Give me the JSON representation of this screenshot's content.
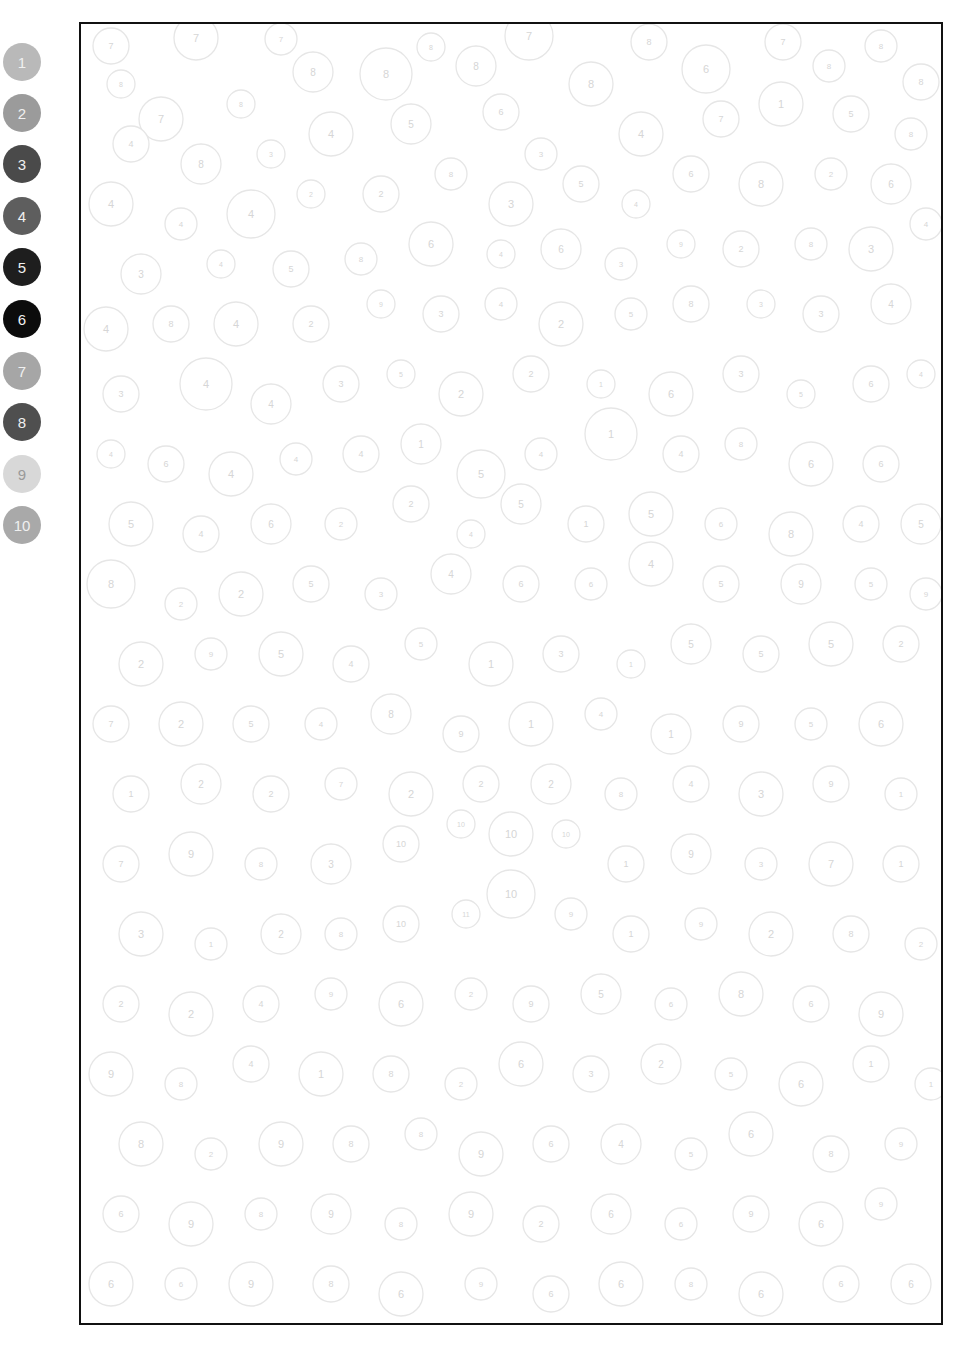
{
  "palette": {
    "swatches": [
      {
        "number": "1",
        "color": "#b9b9b9",
        "top": 43
      },
      {
        "number": "2",
        "color": "#9b9b9b",
        "top": 94
      },
      {
        "number": "3",
        "color": "#4a4a4a",
        "top": 145
      },
      {
        "number": "4",
        "color": "#5e5e5e",
        "top": 197
      },
      {
        "number": "5",
        "color": "#1e1e1e",
        "top": 248
      },
      {
        "number": "6",
        "color": "#0c0c0c",
        "top": 300
      },
      {
        "number": "7",
        "color": "#a6a6a6",
        "top": 352
      },
      {
        "number": "8",
        "color": "#4f4f4f",
        "top": 403
      },
      {
        "number": "9",
        "color": "#d8d8d8",
        "top": 455
      },
      {
        "number": "10",
        "color": "#a9a9a9",
        "top": 506
      }
    ]
  },
  "canvas": {
    "width": 860,
    "height": 1299,
    "border_color": "#111111",
    "circle_stroke": "#e6e6e6",
    "label_color": "#d6d6d6",
    "circles": [
      [
        30,
        22,
        18,
        "7"
      ],
      [
        115,
        14,
        22,
        "7"
      ],
      [
        200,
        15,
        16,
        "7"
      ],
      [
        232,
        48,
        20,
        "8"
      ],
      [
        305,
        50,
        26,
        "8"
      ],
      [
        350,
        23,
        14,
        "8"
      ],
      [
        395,
        42,
        20,
        "8"
      ],
      [
        448,
        12,
        24,
        "7"
      ],
      [
        510,
        60,
        22,
        "8"
      ],
      [
        568,
        18,
        18,
        "8"
      ],
      [
        625,
        45,
        24,
        "6"
      ],
      [
        702,
        18,
        18,
        "7"
      ],
      [
        748,
        42,
        16,
        "8"
      ],
      [
        800,
        22,
        16,
        "8"
      ],
      [
        840,
        58,
        18,
        "8"
      ],
      [
        40,
        60,
        14,
        "8"
      ],
      [
        80,
        95,
        22,
        "7"
      ],
      [
        160,
        80,
        14,
        "8"
      ],
      [
        50,
        120,
        18,
        "4"
      ],
      [
        120,
        140,
        20,
        "8"
      ],
      [
        190,
        130,
        14,
        "3"
      ],
      [
        250,
        110,
        22,
        "4"
      ],
      [
        330,
        100,
        20,
        "5"
      ],
      [
        420,
        88,
        18,
        "6"
      ],
      [
        460,
        130,
        16,
        "3"
      ],
      [
        560,
        110,
        22,
        "4"
      ],
      [
        640,
        95,
        18,
        "7"
      ],
      [
        700,
        80,
        22,
        "1"
      ],
      [
        770,
        90,
        18,
        "5"
      ],
      [
        830,
        110,
        16,
        "8"
      ],
      [
        30,
        180,
        22,
        "4"
      ],
      [
        100,
        200,
        16,
        "4"
      ],
      [
        170,
        190,
        24,
        "4"
      ],
      [
        230,
        170,
        14,
        "2"
      ],
      [
        300,
        170,
        18,
        "2"
      ],
      [
        370,
        150,
        16,
        "8"
      ],
      [
        430,
        180,
        22,
        "3"
      ],
      [
        500,
        160,
        18,
        "5"
      ],
      [
        555,
        180,
        14,
        "4"
      ],
      [
        610,
        150,
        18,
        "6"
      ],
      [
        680,
        160,
        22,
        "8"
      ],
      [
        750,
        150,
        16,
        "2"
      ],
      [
        810,
        160,
        20,
        "6"
      ],
      [
        60,
        250,
        20,
        "3"
      ],
      [
        140,
        240,
        14,
        "4"
      ],
      [
        210,
        245,
        18,
        "5"
      ],
      [
        280,
        235,
        16,
        "8"
      ],
      [
        350,
        220,
        22,
        "6"
      ],
      [
        420,
        230,
        14,
        "4"
      ],
      [
        480,
        225,
        20,
        "6"
      ],
      [
        540,
        240,
        16,
        "3"
      ],
      [
        600,
        220,
        14,
        "9"
      ],
      [
        660,
        225,
        18,
        "2"
      ],
      [
        730,
        220,
        16,
        "8"
      ],
      [
        790,
        225,
        22,
        "3"
      ],
      [
        845,
        200,
        16,
        "4"
      ],
      [
        25,
        305,
        22,
        "4"
      ],
      [
        90,
        300,
        18,
        "8"
      ],
      [
        155,
        300,
        22,
        "4"
      ],
      [
        230,
        300,
        18,
        "2"
      ],
      [
        300,
        280,
        14,
        "9"
      ],
      [
        360,
        290,
        18,
        "3"
      ],
      [
        420,
        280,
        16,
        "4"
      ],
      [
        480,
        300,
        22,
        "2"
      ],
      [
        550,
        290,
        16,
        "5"
      ],
      [
        610,
        280,
        18,
        "8"
      ],
      [
        680,
        280,
        14,
        "3"
      ],
      [
        740,
        290,
        18,
        "3"
      ],
      [
        810,
        280,
        20,
        "4"
      ],
      [
        40,
        370,
        18,
        "3"
      ],
      [
        125,
        360,
        26,
        "4"
      ],
      [
        190,
        380,
        20,
        "4"
      ],
      [
        260,
        360,
        18,
        "3"
      ],
      [
        320,
        350,
        14,
        "5"
      ],
      [
        380,
        370,
        22,
        "2"
      ],
      [
        450,
        350,
        18,
        "2"
      ],
      [
        520,
        360,
        14,
        "1"
      ],
      [
        590,
        370,
        22,
        "6"
      ],
      [
        660,
        350,
        18,
        "3"
      ],
      [
        720,
        370,
        14,
        "5"
      ],
      [
        790,
        360,
        18,
        "6"
      ],
      [
        840,
        350,
        14,
        "4"
      ],
      [
        30,
        430,
        14,
        "4"
      ],
      [
        85,
        440,
        18,
        "6"
      ],
      [
        150,
        450,
        22,
        "4"
      ],
      [
        215,
        435,
        16,
        "4"
      ],
      [
        280,
        430,
        18,
        "4"
      ],
      [
        340,
        420,
        20,
        "1"
      ],
      [
        400,
        450,
        24,
        "5"
      ],
      [
        460,
        430,
        16,
        "4"
      ],
      [
        530,
        410,
        26,
        "1"
      ],
      [
        600,
        430,
        18,
        "4"
      ],
      [
        660,
        420,
        16,
        "8"
      ],
      [
        730,
        440,
        22,
        "6"
      ],
      [
        800,
        440,
        18,
        "6"
      ],
      [
        50,
        500,
        22,
        "5"
      ],
      [
        120,
        510,
        18,
        "4"
      ],
      [
        190,
        500,
        20,
        "6"
      ],
      [
        260,
        500,
        16,
        "2"
      ],
      [
        330,
        480,
        18,
        "2"
      ],
      [
        390,
        510,
        14,
        "4"
      ],
      [
        440,
        480,
        20,
        "5"
      ],
      [
        505,
        500,
        18,
        "1"
      ],
      [
        570,
        490,
        22,
        "5"
      ],
      [
        640,
        500,
        16,
        "6"
      ],
      [
        710,
        510,
        22,
        "8"
      ],
      [
        780,
        500,
        18,
        "4"
      ],
      [
        840,
        500,
        20,
        "5"
      ],
      [
        30,
        560,
        24,
        "8"
      ],
      [
        100,
        580,
        16,
        "2"
      ],
      [
        160,
        570,
        22,
        "2"
      ],
      [
        230,
        560,
        18,
        "5"
      ],
      [
        300,
        570,
        16,
        "3"
      ],
      [
        370,
        550,
        20,
        "4"
      ],
      [
        440,
        560,
        18,
        "6"
      ],
      [
        510,
        560,
        16,
        "6"
      ],
      [
        570,
        540,
        22,
        "4"
      ],
      [
        640,
        560,
        18,
        "5"
      ],
      [
        720,
        560,
        20,
        "9"
      ],
      [
        790,
        560,
        16,
        "5"
      ],
      [
        845,
        570,
        16,
        "9"
      ],
      [
        60,
        640,
        22,
        "2"
      ],
      [
        130,
        630,
        16,
        "9"
      ],
      [
        200,
        630,
        22,
        "5"
      ],
      [
        270,
        640,
        18,
        "4"
      ],
      [
        340,
        620,
        16,
        "5"
      ],
      [
        410,
        640,
        22,
        "1"
      ],
      [
        480,
        630,
        18,
        "3"
      ],
      [
        550,
        640,
        14,
        "1"
      ],
      [
        610,
        620,
        20,
        "5"
      ],
      [
        680,
        630,
        18,
        "5"
      ],
      [
        750,
        620,
        22,
        "5"
      ],
      [
        820,
        620,
        18,
        "2"
      ],
      [
        30,
        700,
        18,
        "7"
      ],
      [
        100,
        700,
        22,
        "2"
      ],
      [
        170,
        700,
        18,
        "5"
      ],
      [
        240,
        700,
        16,
        "4"
      ],
      [
        310,
        690,
        20,
        "8"
      ],
      [
        380,
        710,
        18,
        "9"
      ],
      [
        450,
        700,
        22,
        "1"
      ],
      [
        520,
        690,
        16,
        "4"
      ],
      [
        590,
        710,
        20,
        "1"
      ],
      [
        660,
        700,
        18,
        "9"
      ],
      [
        730,
        700,
        16,
        "5"
      ],
      [
        800,
        700,
        22,
        "6"
      ],
      [
        50,
        770,
        18,
        "1"
      ],
      [
        120,
        760,
        20,
        "2"
      ],
      [
        190,
        770,
        18,
        "2"
      ],
      [
        260,
        760,
        16,
        "7"
      ],
      [
        330,
        770,
        22,
        "2"
      ],
      [
        400,
        760,
        18,
        "2"
      ],
      [
        470,
        760,
        20,
        "2"
      ],
      [
        540,
        770,
        16,
        "8"
      ],
      [
        610,
        760,
        18,
        "4"
      ],
      [
        680,
        770,
        22,
        "3"
      ],
      [
        750,
        760,
        18,
        "9"
      ],
      [
        820,
        770,
        16,
        "1"
      ],
      [
        40,
        840,
        18,
        "7"
      ],
      [
        110,
        830,
        22,
        "9"
      ],
      [
        180,
        840,
        16,
        "8"
      ],
      [
        250,
        840,
        20,
        "3"
      ],
      [
        320,
        820,
        18,
        "10"
      ],
      [
        380,
        800,
        14,
        "10"
      ],
      [
        430,
        810,
        22,
        "10"
      ],
      [
        485,
        810,
        14,
        "10"
      ],
      [
        545,
        840,
        18,
        "1"
      ],
      [
        610,
        830,
        20,
        "9"
      ],
      [
        680,
        840,
        16,
        "3"
      ],
      [
        750,
        840,
        22,
        "7"
      ],
      [
        820,
        840,
        18,
        "1"
      ],
      [
        60,
        910,
        22,
        "3"
      ],
      [
        130,
        920,
        16,
        "1"
      ],
      [
        200,
        910,
        20,
        "2"
      ],
      [
        260,
        910,
        16,
        "8"
      ],
      [
        320,
        900,
        18,
        "10"
      ],
      [
        385,
        890,
        14,
        "11"
      ],
      [
        430,
        870,
        24,
        "10"
      ],
      [
        490,
        890,
        16,
        "9"
      ],
      [
        550,
        910,
        18,
        "1"
      ],
      [
        620,
        900,
        16,
        "9"
      ],
      [
        690,
        910,
        22,
        "2"
      ],
      [
        770,
        910,
        18,
        "8"
      ],
      [
        840,
        920,
        16,
        "2"
      ],
      [
        40,
        980,
        18,
        "2"
      ],
      [
        110,
        990,
        22,
        "2"
      ],
      [
        180,
        980,
        18,
        "4"
      ],
      [
        250,
        970,
        16,
        "9"
      ],
      [
        320,
        980,
        22,
        "6"
      ],
      [
        390,
        970,
        16,
        "2"
      ],
      [
        450,
        980,
        18,
        "9"
      ],
      [
        520,
        970,
        20,
        "5"
      ],
      [
        590,
        980,
        16,
        "6"
      ],
      [
        660,
        970,
        22,
        "8"
      ],
      [
        730,
        980,
        18,
        "6"
      ],
      [
        800,
        990,
        22,
        "9"
      ],
      [
        30,
        1050,
        22,
        "9"
      ],
      [
        100,
        1060,
        16,
        "8"
      ],
      [
        170,
        1040,
        18,
        "4"
      ],
      [
        240,
        1050,
        22,
        "1"
      ],
      [
        310,
        1050,
        18,
        "8"
      ],
      [
        380,
        1060,
        16,
        "2"
      ],
      [
        440,
        1040,
        22,
        "6"
      ],
      [
        510,
        1050,
        18,
        "3"
      ],
      [
        580,
        1040,
        20,
        "2"
      ],
      [
        650,
        1050,
        16,
        "5"
      ],
      [
        720,
        1060,
        22,
        "6"
      ],
      [
        790,
        1040,
        18,
        "1"
      ],
      [
        850,
        1060,
        16,
        "1"
      ],
      [
        60,
        1120,
        22,
        "8"
      ],
      [
        130,
        1130,
        16,
        "2"
      ],
      [
        200,
        1120,
        22,
        "9"
      ],
      [
        270,
        1120,
        18,
        "8"
      ],
      [
        340,
        1110,
        16,
        "8"
      ],
      [
        400,
        1130,
        22,
        "9"
      ],
      [
        470,
        1120,
        18,
        "6"
      ],
      [
        540,
        1120,
        20,
        "4"
      ],
      [
        610,
        1130,
        16,
        "5"
      ],
      [
        670,
        1110,
        22,
        "6"
      ],
      [
        750,
        1130,
        18,
        "8"
      ],
      [
        820,
        1120,
        16,
        "9"
      ],
      [
        40,
        1190,
        18,
        "6"
      ],
      [
        110,
        1200,
        22,
        "9"
      ],
      [
        180,
        1190,
        16,
        "8"
      ],
      [
        250,
        1190,
        20,
        "9"
      ],
      [
        320,
        1200,
        16,
        "8"
      ],
      [
        390,
        1190,
        22,
        "9"
      ],
      [
        460,
        1200,
        18,
        "2"
      ],
      [
        530,
        1190,
        20,
        "6"
      ],
      [
        600,
        1200,
        16,
        "6"
      ],
      [
        670,
        1190,
        18,
        "9"
      ],
      [
        740,
        1200,
        22,
        "6"
      ],
      [
        800,
        1180,
        16,
        "9"
      ],
      [
        30,
        1260,
        22,
        "6"
      ],
      [
        100,
        1260,
        16,
        "6"
      ],
      [
        170,
        1260,
        22,
        "9"
      ],
      [
        250,
        1260,
        18,
        "8"
      ],
      [
        320,
        1270,
        22,
        "6"
      ],
      [
        400,
        1260,
        16,
        "9"
      ],
      [
        470,
        1270,
        18,
        "6"
      ],
      [
        540,
        1260,
        22,
        "6"
      ],
      [
        610,
        1260,
        16,
        "8"
      ],
      [
        680,
        1270,
        22,
        "6"
      ],
      [
        760,
        1260,
        18,
        "6"
      ],
      [
        830,
        1260,
        20,
        "6"
      ]
    ]
  }
}
